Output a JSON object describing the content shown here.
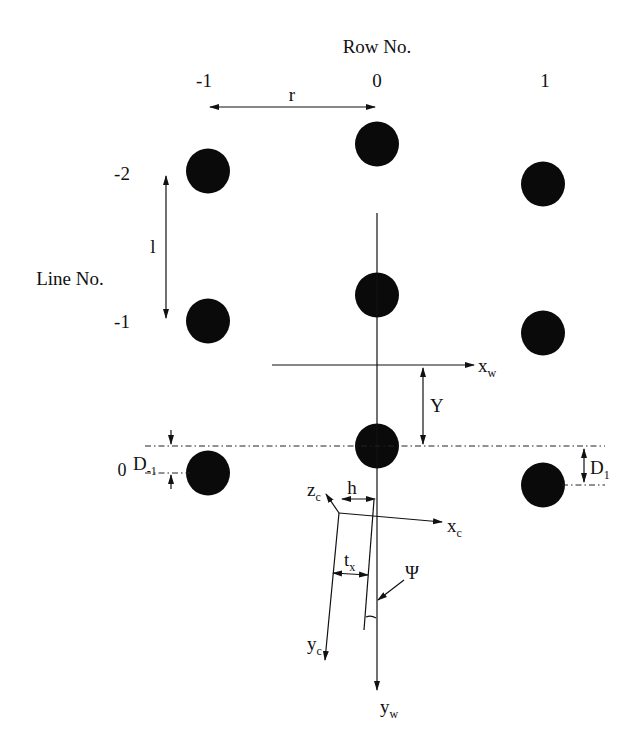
{
  "diagram": {
    "row_axis_title": "Row No.",
    "row_labels": [
      "-1",
      "0",
      "1"
    ],
    "line_axis_title": "Line No.",
    "line_labels": [
      "-2",
      "-1",
      "0"
    ],
    "grid_dots": [
      {
        "row": -1,
        "line": -2
      },
      {
        "row": 0,
        "line": -2
      },
      {
        "row": 1,
        "line": -2
      },
      {
        "row": -1,
        "line": -1
      },
      {
        "row": 0,
        "line": -1
      },
      {
        "row": 1,
        "line": -1
      },
      {
        "row": -1,
        "line": 0
      },
      {
        "row": 0,
        "line": 0
      },
      {
        "row": 1,
        "line": 0
      }
    ],
    "dimension_labels": {
      "row_spacing": "r",
      "line_spacing": "l",
      "offset_y": "Y",
      "offset_h": "h",
      "translation": "t",
      "translation_sub": "x",
      "yaw_angle": "Ψ",
      "d_left": "D",
      "d_left_sub": "-1",
      "d_right": "D",
      "d_right_sub": "1"
    },
    "axes": {
      "world_x": {
        "base": "x",
        "sub": "w"
      },
      "world_y": {
        "base": "y",
        "sub": "w"
      },
      "camera_x": {
        "base": "x",
        "sub": "c"
      },
      "camera_y": {
        "base": "y",
        "sub": "c"
      },
      "camera_z": {
        "base": "z",
        "sub": "c"
      }
    }
  }
}
